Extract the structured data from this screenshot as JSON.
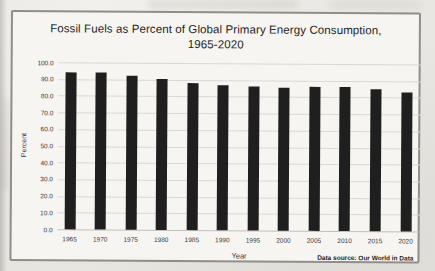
{
  "chart": {
    "title_line1": "Fossil Fuels as Percent of Global Primary Energy Consumption,",
    "title_line2": "1965-2020",
    "ylabel": "Percent",
    "xlabel": "Year",
    "source_note": "Data source: Our World in Data"
  },
  "chart_data": {
    "type": "bar",
    "title": "Fossil Fuels as Percent of Global Primary Energy Consumption, 1965-2020",
    "xlabel": "Year",
    "ylabel": "Percent",
    "categories": [
      "1965",
      "1970",
      "1975",
      "1980",
      "1985",
      "1990",
      "1995",
      "2000",
      "2005",
      "2010",
      "2015",
      "2020"
    ],
    "values": [
      93.8,
      93.9,
      92.0,
      90.5,
      88.2,
      87.0,
      86.2,
      85.8,
      86.4,
      86.2,
      85.3,
      83.0
    ],
    "ylim": [
      0,
      100
    ],
    "ytick_step": 10,
    "yticks": [
      "100.0",
      "90.0",
      "80.0",
      "70.0",
      "60.0",
      "50.0",
      "40.0",
      "30.0",
      "20.0",
      "10.0",
      "0.0"
    ],
    "grid": true,
    "legend": false,
    "annotations": [
      "Data source: Our World in Data"
    ]
  },
  "colors": {
    "bar": "#1f1f1f",
    "gridline": "#dbd8d3",
    "frame_border": "#908e8a",
    "paper": "#f6f5f2",
    "page": "#e9e7e2",
    "text": "#3a3835"
  }
}
